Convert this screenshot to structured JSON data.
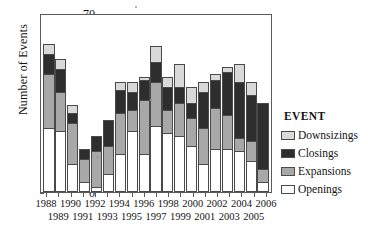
{
  "chart_data": {
    "type": "bar",
    "subtype": "stacked-bar",
    "title": "",
    "xlabel": "",
    "ylabel": "Number of Events",
    "ylim": [
      0,
      70
    ],
    "yticks": [
      0,
      10,
      20,
      30,
      40,
      50,
      60,
      70
    ],
    "grid": false,
    "legend_position": "right",
    "legend_title": "EVENT",
    "categories": [
      "1988",
      "1989",
      "1990",
      "1991",
      "1992",
      "1993",
      "1994",
      "1995",
      "1996",
      "1997",
      "1998",
      "1999",
      "2000",
      "2001",
      "2002",
      "2003",
      "2004",
      "2005",
      "2006"
    ],
    "series": [
      {
        "name": "Openings",
        "color": "#ffffff",
        "values": [
          25,
          24,
          11,
          4,
          2,
          7,
          15,
          24,
          15,
          26,
          23,
          22,
          18,
          11,
          17,
          17,
          16,
          12,
          4
        ]
      },
      {
        "name": "Expansions",
        "color": "#a8a8a8",
        "values": [
          21,
          15,
          16,
          9,
          14,
          11,
          16,
          8,
          21,
          17,
          9,
          13,
          11,
          14,
          16,
          13,
          5,
          8,
          5
        ]
      },
      {
        "name": "Closings",
        "color": "#2e2e2e",
        "values": [
          8,
          9,
          4,
          4,
          6,
          10,
          9,
          7,
          8,
          8,
          9,
          6,
          6,
          14,
          11,
          17,
          22,
          18,
          26
        ]
      },
      {
        "name": "Downsizings",
        "color": "#d9d9d9",
        "values": [
          4,
          4,
          3,
          0,
          0,
          0,
          3,
          4,
          1,
          6,
          4,
          9,
          6,
          4,
          2,
          2,
          7,
          5,
          0
        ]
      }
    ],
    "totals": [
      58,
      52,
      34,
      17,
      22,
      28,
      43,
      43,
      45,
      57,
      45,
      50,
      41,
      43,
      46,
      49,
      50,
      43,
      35
    ]
  },
  "legend": {
    "title": "EVENT",
    "items": [
      {
        "label": "Downsizings",
        "color": "#d9d9d9"
      },
      {
        "label": "Closings",
        "color": "#2e2e2e"
      },
      {
        "label": "Expansions",
        "color": "#a8a8a8"
      },
      {
        "label": "Openings",
        "color": "#ffffff"
      }
    ]
  },
  "axes": {
    "y_title": "Number of Events",
    "y_ticks": [
      "70",
      "60",
      "50",
      "40",
      "30",
      "20",
      "10",
      "0"
    ],
    "x_labels_row_top": [
      "1988",
      "1990",
      "1992",
      "1994",
      "1996",
      "1998",
      "2000",
      "2002",
      "2004",
      "2006"
    ],
    "x_labels_row_bottom": [
      "1989",
      "1991",
      "1993",
      "1995",
      "1997",
      "1999",
      "2001",
      "2003",
      "2005"
    ]
  }
}
